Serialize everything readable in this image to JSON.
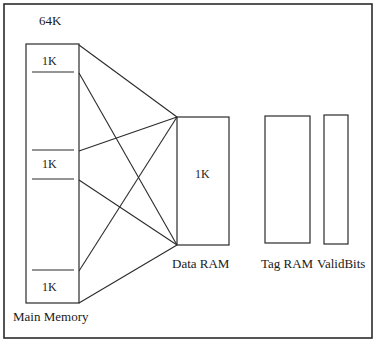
{
  "figure": {
    "width": 381,
    "height": 347,
    "background_color": "#ffffff",
    "line_color": "#2b2b2b",
    "text_color": "#1a1a1a",
    "border": {
      "name": "figure-border",
      "x": 4,
      "y": 4,
      "width": 368,
      "height": 334,
      "stroke_width": 1.6
    }
  },
  "labels": {
    "capacity": "64K",
    "main_memory": "Main Memory",
    "main_memory_block_top": "1K",
    "main_memory_block_middle": "1K",
    "main_memory_block_bottom": "1K",
    "data_ram_size": "1K",
    "data_ram": "Data RAM",
    "tag_ram": "Tag RAM",
    "valid_bits": "ValidBits"
  },
  "boxes": [
    {
      "name": "main-memory-box",
      "label": "Main Memory",
      "x": 26,
      "y": 44,
      "width": 53,
      "height": 259
    },
    {
      "name": "data-ram-box",
      "label": "Data RAM",
      "x": 177,
      "y": 117,
      "width": 52,
      "height": 128
    },
    {
      "name": "tag-ram-box",
      "label": "Tag RAM",
      "x": 265,
      "y": 116,
      "width": 45,
      "height": 127
    },
    {
      "name": "valid-bits-box",
      "label": "ValidBits",
      "x": 324,
      "y": 115,
      "width": 24,
      "height": 129
    }
  ],
  "dividers": [
    {
      "name": "divider-block-1-bottom",
      "x1": 32,
      "y1": 72,
      "x2": 74,
      "y2": 72
    },
    {
      "name": "divider-block-2-top",
      "x1": 32,
      "y1": 150,
      "x2": 74,
      "y2": 150
    },
    {
      "name": "divider-block-2-bottom",
      "x1": 32,
      "y1": 179,
      "x2": 74,
      "y2": 179
    },
    {
      "name": "divider-block-3-top",
      "x1": 32,
      "y1": 270,
      "x2": 74,
      "y2": 270
    }
  ],
  "connectors": [
    {
      "name": "connector-block1-top-to-dataram-top",
      "x1": 79,
      "y1": 45,
      "x2": 177,
      "y2": 117
    },
    {
      "name": "connector-block1-bottom-to-dataram-bot",
      "x1": 79,
      "y1": 73,
      "x2": 177,
      "y2": 245
    },
    {
      "name": "connector-block2-top-to-dataram-top",
      "x1": 79,
      "y1": 151,
      "x2": 177,
      "y2": 117
    },
    {
      "name": "connector-block2-bottom-to-dataram-bot",
      "x1": 79,
      "y1": 180,
      "x2": 177,
      "y2": 245
    },
    {
      "name": "connector-block3-top-to-dataram-top",
      "x1": 79,
      "y1": 271,
      "x2": 177,
      "y2": 117
    },
    {
      "name": "connector-block3-bottom-to-dataram-bot",
      "x1": 79,
      "y1": 303,
      "x2": 177,
      "y2": 245
    }
  ]
}
